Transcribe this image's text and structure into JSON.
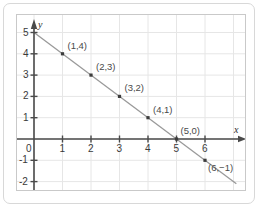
{
  "chart_data": {
    "type": "line",
    "title": "",
    "subtitle": "",
    "xlabel": "x",
    "ylabel": "y",
    "xlim": [
      -0.45,
      7.0
    ],
    "ylim": [
      -2.4,
      5.3
    ],
    "grid": true,
    "legend": null,
    "x_ticks": [
      "0",
      "1",
      "2",
      "3",
      "4",
      "5",
      "6"
    ],
    "x_tick_values": [
      0,
      1,
      2,
      3,
      4,
      5,
      6
    ],
    "y_ticks": [
      "-2",
      "-1",
      "0",
      "1",
      "2",
      "3",
      "4",
      "5"
    ],
    "y_tick_values": [
      -2,
      -1,
      0,
      1,
      2,
      3,
      4,
      5
    ],
    "origin_label": "0",
    "series": [
      {
        "name": "y = -x + 5",
        "line_color": "#9a9a9a",
        "marker_color": "#3c3c3c",
        "x": [
          1,
          2,
          3,
          4,
          5,
          6
        ],
        "values": [
          4,
          3,
          2,
          1,
          0,
          -1
        ],
        "point_labels": [
          "(1,4)",
          "(2,3)",
          "(3,2)",
          "(4,1)",
          "(5,0)",
          "(6,−1)"
        ]
      }
    ],
    "line_extent": {
      "x_start": 0,
      "y_start": 5,
      "x_end": 7.1,
      "y_end": -2.1
    },
    "colors": {
      "axis": "#4a4a4a",
      "grid": "#e6e6e6",
      "line": "#9a9a9a",
      "marker": "#3c3c3c",
      "text": "#3a3a3a",
      "frame": "#c9c9c9",
      "card_border": "#d8d8d8",
      "background": "#ffffff"
    }
  },
  "labels": {
    "x_axis_name": "x",
    "y_axis_name": "y",
    "origin": "0",
    "x_ticks": [
      "1",
      "2",
      "3",
      "4",
      "5",
      "6"
    ],
    "y_ticks_positive": [
      "1",
      "2",
      "3",
      "4",
      "5"
    ],
    "y_ticks_negative": [
      "-1",
      "-2"
    ],
    "points": [
      {
        "text": "(1,4)"
      },
      {
        "text": "(2,3)"
      },
      {
        "text": "(3,2)"
      },
      {
        "text": "(4,1)"
      },
      {
        "text": "(5,0)"
      },
      {
        "text": "(6,−1)"
      }
    ]
  }
}
